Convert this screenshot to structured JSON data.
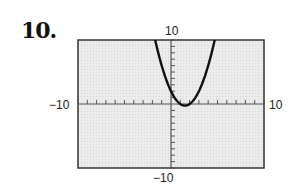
{
  "problem": {
    "number": "10."
  },
  "window": {
    "xmin_label": "−10",
    "xmax_label": "10",
    "ymin_label": "−10",
    "ymax_label": "10"
  },
  "colors": {
    "background": "#ffffff",
    "plot_fill": "#e6e6e6",
    "axis": "#555555",
    "curve": "#111111",
    "border": "#333333"
  },
  "chart_data": {
    "type": "line",
    "title": "",
    "xlabel": "",
    "ylabel": "",
    "xlim": [
      -10,
      10
    ],
    "ylim": [
      -10,
      10
    ],
    "xscale": 1,
    "yscale": 1,
    "grid": false,
    "tick_labels": {
      "x": [
        "-10",
        "10"
      ],
      "y": [
        "-10",
        "10"
      ]
    },
    "series": [
      {
        "name": "parabola (approx. y = x^2 - 3x + 2)",
        "x": [
          -1.5,
          -1.0,
          -0.5,
          0.0,
          0.5,
          1.0,
          1.5,
          2.0,
          2.5,
          3.0,
          3.5,
          4.0,
          4.5
        ],
        "y": [
          8.75,
          6.0,
          3.75,
          2.0,
          0.75,
          0.0,
          -0.25,
          0.0,
          0.75,
          2.0,
          3.75,
          6.0,
          8.75
        ]
      }
    ],
    "annotations": [
      "vertex near (1.5, -0.25)"
    ]
  }
}
